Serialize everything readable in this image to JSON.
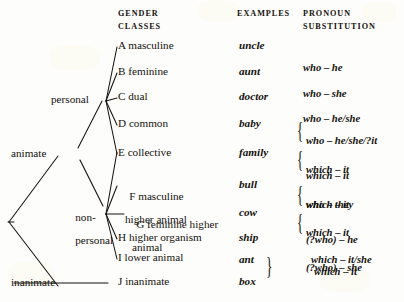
{
  "figure": {
    "background_color": "#fdfdfb",
    "ink_color": "#15120e"
  },
  "headers": {
    "gender_classes_line1": "GENDER",
    "gender_classes_line2": "CLASSES",
    "examples": "EXAMPLES",
    "pronoun_line1": "PRONOUN",
    "pronoun_line2": "SUBSTITUTION"
  },
  "nodes": [
    {
      "id": "animate",
      "label": "animate"
    },
    {
      "id": "inanimate",
      "label": "inanimate"
    },
    {
      "id": "personal",
      "label": "personal"
    },
    {
      "id": "nonpersonal_line1",
      "label": "non-"
    },
    {
      "id": "nonpersonal_line2",
      "label": "personal"
    }
  ],
  "rows": [
    {
      "letter": "A",
      "class_line1": "A masculine",
      "class_line2": "",
      "example": "uncle",
      "pronoun_lines": [
        "who – he"
      ],
      "braced": false
    },
    {
      "letter": "B",
      "class_line1": "B feminine",
      "class_line2": "",
      "example": "aunt",
      "pronoun_lines": [
        "who – she"
      ],
      "braced": false
    },
    {
      "letter": "C",
      "class_line1": "C dual",
      "class_line2": "",
      "example": "doctor",
      "pronoun_lines": [
        "who – he/she"
      ],
      "braced": false
    },
    {
      "letter": "D",
      "class_line1": "D common",
      "class_line2": "",
      "example": "baby",
      "pronoun_lines": [
        "who – he/she/?it",
        "which – it"
      ],
      "braced": true
    },
    {
      "letter": "E",
      "class_line1": "E collective",
      "class_line2": "",
      "example": "family",
      "pronoun_lines": [
        "which – it",
        "who – they"
      ],
      "braced": true
    },
    {
      "letter": "F",
      "class_line1": "F masculine",
      "class_line2": "higher animal",
      "example": "bull",
      "pronoun_lines": [
        "which – it",
        "(?who) – he"
      ],
      "braced": true
    },
    {
      "letter": "G",
      "class_line1": "G feminine higher",
      "class_line2": "animal",
      "example": "cow",
      "pronoun_lines": [
        "which – it",
        "(?who) – she"
      ],
      "braced": true
    },
    {
      "letter": "H",
      "class_line1": "H higher organism",
      "class_line2": "",
      "example": "ship",
      "pronoun_lines": [
        "which – it/she"
      ],
      "braced": false
    },
    {
      "letter": "I",
      "class_line1": "I lower animal",
      "class_line2": "",
      "example": "ant",
      "pronoun_lines": [],
      "braced": false
    },
    {
      "letter": "J",
      "class_line1": "J inanimate",
      "class_line2": "",
      "example": "box",
      "pronoun_lines": [],
      "braced": false
    }
  ],
  "shared_pronoun_ij": "which – it",
  "braces": {
    "glyph": "{",
    "example_group_glyph": "}"
  }
}
